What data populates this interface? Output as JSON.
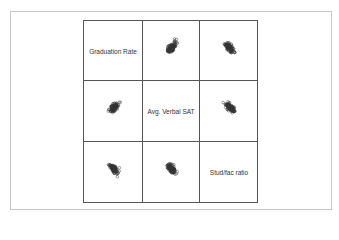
{
  "chart_data": {
    "type": "scatter",
    "subtype": "scatterplot-matrix",
    "title": "",
    "variables": [
      "Graduation Rate",
      "Avg. Verbal SAT",
      "Stud/fac ratio"
    ],
    "grid": false,
    "legend": null,
    "marker": "open-circle",
    "panels": [
      {
        "row": 0,
        "col": 1,
        "x": "Avg. Verbal SAT",
        "y": "Graduation Rate",
        "trend": "positive"
      },
      {
        "row": 0,
        "col": 2,
        "x": "Stud/fac ratio",
        "y": "Graduation Rate",
        "trend": "negative"
      },
      {
        "row": 1,
        "col": 0,
        "x": "Graduation Rate",
        "y": "Avg. Verbal SAT",
        "trend": "positive"
      },
      {
        "row": 1,
        "col": 2,
        "x": "Stud/fac ratio",
        "y": "Avg. Verbal SAT",
        "trend": "negative"
      },
      {
        "row": 2,
        "col": 0,
        "x": "Graduation Rate",
        "y": "Stud/fac ratio",
        "trend": "negative"
      },
      {
        "row": 2,
        "col": 1,
        "x": "Avg. Verbal SAT",
        "y": "Stud/fac ratio",
        "trend": "negative"
      }
    ],
    "point_count_per_panel": 120
  },
  "colors": {
    "frame": "#c8c8c8",
    "grid_lines": "#555555",
    "marker": "#333333",
    "label": "#333333"
  }
}
